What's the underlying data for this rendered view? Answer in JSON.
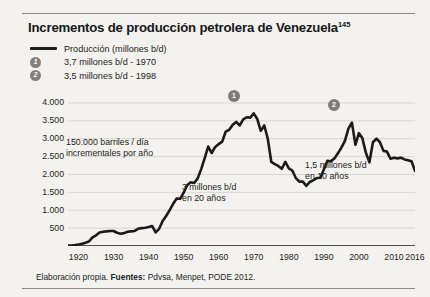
{
  "figure": {
    "title": "Incrementos de producción petrolera de Venezuela",
    "footnote_marker": "145",
    "source_prefix": "Elaboración propia.",
    "source_label": "Fuentes:",
    "source_text": "Pdvsa, Menpet, PODE 2012."
  },
  "legend": [
    {
      "type": "line",
      "key": "",
      "label": "Producción (millones b/d)"
    },
    {
      "type": "badge",
      "key": "1",
      "label": "3,7 millones b/d - 1970"
    },
    {
      "type": "badge",
      "key": "2",
      "label": "3,5 millones b/d - 1998"
    }
  ],
  "colors": {
    "series_line": "#1b1b1b",
    "badge": "#7e7c79",
    "grid": "#d9d7d2",
    "background": "#f3f2ef",
    "rule": "#8d8a85",
    "text": "#1d1e20"
  },
  "chart_data": {
    "type": "line",
    "title": "Incrementos de producción petrolera de Venezuela",
    "xlabel": "",
    "ylabel": "",
    "xlim": [
      1917,
      2016
    ],
    "ylim": [
      0,
      4250
    ],
    "yticks": [
      500,
      1000,
      1500,
      2000,
      2500,
      3000,
      3500,
      4000
    ],
    "ytick_labels": [
      "500",
      "1.000",
      "1.500",
      "2.000",
      "2.500",
      "3.000",
      "3.500",
      "4.000"
    ],
    "xticks": [
      1920,
      1930,
      1940,
      1950,
      1960,
      1970,
      1980,
      1990,
      2000,
      2010,
      2016
    ],
    "xtick_labels": [
      "1920",
      "1930",
      "1940",
      "1950",
      "1960",
      "1970",
      "1980",
      "1990",
      "2000",
      "2010",
      "2016"
    ],
    "grid": true,
    "legend_position": "top-left",
    "series": [
      {
        "name": "Producción (millones b/d)",
        "unit": "miles de barriles / día",
        "x": [
          1917,
          1918,
          1919,
          1920,
          1921,
          1922,
          1923,
          1924,
          1925,
          1926,
          1927,
          1928,
          1929,
          1930,
          1931,
          1932,
          1933,
          1934,
          1935,
          1936,
          1937,
          1938,
          1939,
          1940,
          1941,
          1942,
          1943,
          1944,
          1945,
          1946,
          1947,
          1948,
          1949,
          1950,
          1951,
          1952,
          1953,
          1954,
          1955,
          1956,
          1957,
          1958,
          1959,
          1960,
          1961,
          1962,
          1963,
          1964,
          1965,
          1966,
          1967,
          1968,
          1969,
          1970,
          1971,
          1972,
          1973,
          1974,
          1975,
          1976,
          1977,
          1978,
          1979,
          1980,
          1981,
          1982,
          1983,
          1984,
          1985,
          1986,
          1987,
          1988,
          1989,
          1990,
          1991,
          1992,
          1993,
          1994,
          1995,
          1996,
          1997,
          1998,
          1999,
          2000,
          2001,
          2002,
          2003,
          2004,
          2005,
          2006,
          2007,
          2008,
          2009,
          2010,
          2011,
          2012,
          2013,
          2014,
          2015,
          2016
        ],
        "values": [
          10,
          15,
          25,
          40,
          60,
          90,
          130,
          240,
          300,
          380,
          400,
          410,
          420,
          420,
          370,
          340,
          360,
          400,
          410,
          420,
          480,
          500,
          510,
          530,
          560,
          380,
          480,
          700,
          840,
          1000,
          1180,
          1330,
          1320,
          1490,
          1700,
          1780,
          1760,
          1890,
          2150,
          2460,
          2780,
          2600,
          2770,
          2850,
          2920,
          3200,
          3250,
          3390,
          3470,
          3370,
          3540,
          3600,
          3590,
          3710,
          3550,
          3220,
          3370,
          3000,
          2350,
          2290,
          2240,
          2160,
          2350,
          2170,
          2110,
          1900,
          1800,
          1800,
          1680,
          1790,
          1840,
          1900,
          1910,
          2140,
          2380,
          2370,
          2450,
          2590,
          2750,
          2940,
          3280,
          3450,
          2830,
          3155,
          3010,
          2600,
          2340,
          2900,
          3000,
          2900,
          2660,
          2640,
          2440,
          2470,
          2450,
          2470,
          2420,
          2400,
          2370,
          2100
        ]
      }
    ],
    "point_markers": [
      {
        "key": "1",
        "x": 1970,
        "y": 3710,
        "label": "3,7 millones b/d - 1970"
      },
      {
        "key": "2",
        "x": 1998,
        "y": 3450,
        "label": "3,5 millones b/d - 1998"
      }
    ],
    "annotations": [
      {
        "id": 0,
        "lines": [
          "150.000 barriles / día",
          "incrementales por año"
        ]
      },
      {
        "id": 1,
        "lines": [
          "3 millones b/d",
          "en 20 años"
        ]
      },
      {
        "id": 2,
        "lines": [
          "1,5 millones b/d",
          "en 10 años"
        ]
      }
    ]
  }
}
